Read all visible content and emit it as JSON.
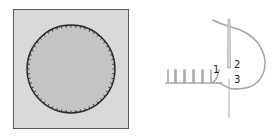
{
  "diagram": {
    "left_figure": {
      "description": "circular patch blanket-stitched onto square fabric",
      "fabric_color": "#d9d9d9",
      "fabric_border_color": "#5a5a5a",
      "patch_color": "#c4c4c4",
      "stitch_color": "#2a2a2a"
    },
    "right_figure": {
      "description": "blanket stitch step diagram with needle",
      "thread_color": "#a8a8a8",
      "needle_color": "#bdbdbd",
      "labels": [
        {
          "id": "1",
          "text": "1"
        },
        {
          "id": "2",
          "text": "2"
        },
        {
          "id": "3",
          "text": "3"
        }
      ]
    }
  }
}
